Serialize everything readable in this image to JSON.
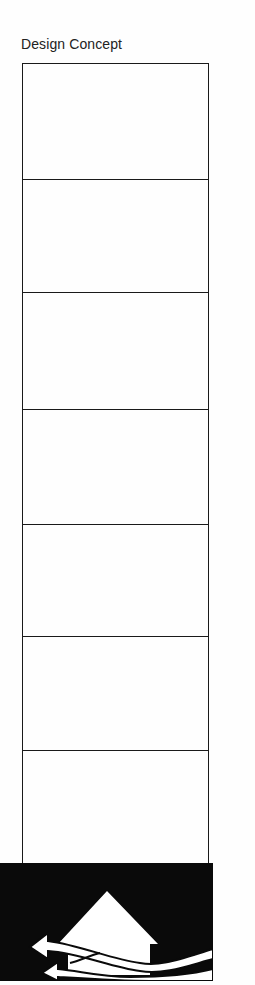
{
  "title": "Design Concept",
  "stack": {
    "cells": 7,
    "divider_y": [
      179,
      292,
      409,
      524,
      636,
      750
    ]
  },
  "emblem": {
    "icon": "house-with-airflow-arrows-icon",
    "background": "#0a0a0a",
    "foreground": "#ffffff"
  }
}
